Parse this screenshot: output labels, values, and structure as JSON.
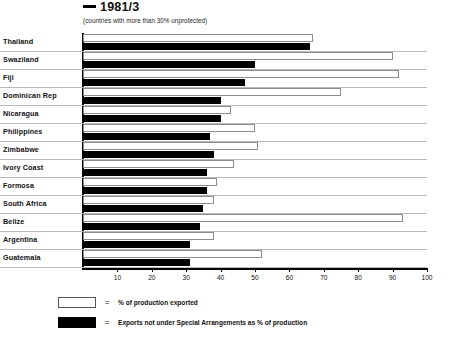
{
  "chart": {
    "title": "1981/3",
    "title_dash": "—",
    "subtitle": "(countries with more than 30% unprotected)"
  },
  "legend": {
    "equals": "=",
    "items": [
      {
        "swatch": "white",
        "label": "% of production exported"
      },
      {
        "swatch": "black",
        "label": "Exports not under Special Arrangements as % of production"
      }
    ]
  },
  "axis": {
    "ticks": [
      "10",
      "20",
      "30",
      "40",
      "50",
      "60",
      "70",
      "80",
      "90",
      "100"
    ]
  },
  "chart_data": {
    "type": "bar",
    "orientation": "horizontal",
    "title": "— 1981/3",
    "subtitle": "(countries with more than 30% unprotected)",
    "xlabel": "",
    "ylabel": "",
    "xlim": [
      0,
      100
    ],
    "grid": false,
    "legend_position": "bottom-left",
    "xticks": [
      10,
      20,
      30,
      40,
      50,
      60,
      70,
      80,
      90,
      100
    ],
    "categories": [
      "Thailand",
      "Swaziland",
      "Fiji",
      "Dominican Rep",
      "Nicaragua",
      "Philippines",
      "Zimbabwe",
      "Ivory Coast",
      "Formosa",
      "South Africa",
      "Belize",
      "Argentina",
      "Guatemala"
    ],
    "series": [
      {
        "name": "% of production exported",
        "color": "#ffffff",
        "values": [
          67,
          90,
          92,
          75,
          43,
          50,
          51,
          44,
          39,
          38,
          93,
          38,
          52
        ]
      },
      {
        "name": "Exports not under Special Arrangements as % of production",
        "color": "#000000",
        "values": [
          66,
          50,
          47,
          40,
          40,
          37,
          38,
          36,
          36,
          35,
          34,
          31,
          31
        ]
      }
    ]
  }
}
